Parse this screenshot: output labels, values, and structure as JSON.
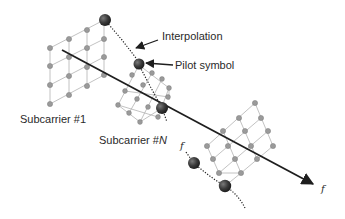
{
  "diagram": {
    "labels": {
      "interpolation": "Interpolation",
      "pilot_symbol": "Pilot symbol",
      "subcarrier_first": "Subcarrier #1",
      "subcarrier_n_prefix": "Subcarrier #",
      "subcarrier_n_suffix": "N",
      "frequency_axis": "f",
      "frequency_curve": "f"
    },
    "colors": {
      "pilot_ball": "#3a3a3a",
      "small_dot": "#9a9a9a",
      "grid_line": "#b3b3b3",
      "axis": "#1e1e1e"
    }
  }
}
